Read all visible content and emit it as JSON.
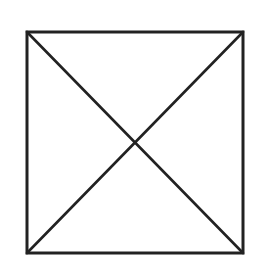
{
  "diagram": {
    "type": "square-with-diagonals",
    "shape": "square",
    "stroke_color": "#222222",
    "background_color": "#ffffff",
    "stroke_width": 3,
    "square": {
      "x1": 27,
      "y1": 32,
      "x2": 243,
      "y2": 253
    },
    "diagonals": [
      {
        "name": "top-left-to-bottom-right",
        "x1": 27,
        "y1": 32,
        "x2": 243,
        "y2": 253
      },
      {
        "name": "top-right-to-bottom-left",
        "x1": 243,
        "y1": 32,
        "x2": 27,
        "y2": 253
      }
    ],
    "intersection": {
      "x": 135,
      "y": 142
    }
  }
}
